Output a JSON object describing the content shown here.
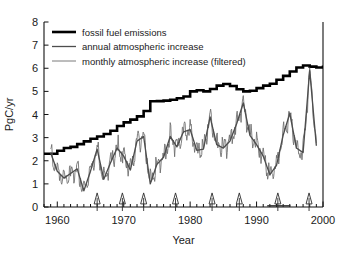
{
  "chart_data": {
    "type": "line",
    "title": "",
    "xlabel": "Year",
    "ylabel": "PgC/yr",
    "xlim": [
      1958,
      2000
    ],
    "ylim": [
      0,
      8
    ],
    "xticks": [
      1960,
      1970,
      1980,
      1990,
      2000
    ],
    "xticklabels": [
      "1960",
      "1970",
      "1980",
      "1990",
      "2000"
    ],
    "yticks": [
      0,
      1,
      2,
      3,
      4,
      5,
      6,
      7,
      8
    ],
    "yticklabels": [
      "0",
      "1",
      "2",
      "3",
      "4",
      "5",
      "6",
      "7",
      "8"
    ],
    "xminor_step": 1,
    "grid": false,
    "legend_position": "upper left",
    "legend": [
      {
        "label": "fossil fuel emissions",
        "color": "#000000",
        "width": 2.6
      },
      {
        "label": "annual atmospheric increase",
        "color": "#4d4d4d",
        "width": 1.3
      },
      {
        "label": "monthly atmospheric increase (filtered)",
        "color": "#6b6b6b",
        "width": 0.9
      }
    ],
    "annotations": {
      "event_arrows": {
        "name": "volcanic-eruption-arrows",
        "symbol": "up-triangle-arrow",
        "y": 0.35,
        "years": [
          1966.0,
          1969.8,
          1973.0,
          1977.8,
          1983.3,
          1987.4,
          1993.2,
          1997.9
        ]
      },
      "interval_bar": {
        "name": "pinatubo-interval-bar",
        "y": 0.05,
        "x_start": 1991.6,
        "x_end": 1995.1
      }
    },
    "series": [
      {
        "name": "fossil fuel emissions",
        "style": "step",
        "color": "#000000",
        "x": [
          1958,
          1959,
          1960,
          1961,
          1962,
          1963,
          1964,
          1965,
          1966,
          1967,
          1968,
          1969,
          1970,
          1971,
          1972,
          1973,
          1974,
          1975,
          1976,
          1977,
          1978,
          1979,
          1980,
          1981,
          1982,
          1983,
          1984,
          1985,
          1986,
          1987,
          1988,
          1989,
          1990,
          1991,
          1992,
          1993,
          1994,
          1995,
          1996,
          1997,
          1998,
          1999,
          2000
        ],
        "values": [
          2.3,
          2.3,
          2.43,
          2.55,
          2.6,
          2.72,
          2.84,
          2.95,
          3.05,
          3.16,
          3.3,
          3.5,
          3.66,
          3.78,
          3.92,
          4.15,
          4.57,
          4.58,
          4.6,
          4.64,
          4.7,
          4.78,
          5.0,
          5.05,
          5.0,
          5.1,
          5.25,
          5.32,
          5.23,
          5.09,
          5.0,
          5.03,
          5.14,
          5.25,
          5.33,
          5.5,
          5.67,
          5.86,
          6.03,
          6.12,
          6.07,
          6.03,
          6.12
        ],
        "values_note": "step-constant annual totals"
      },
      {
        "name": "annual atmospheric increase",
        "style": "line",
        "color": "#4d4d4d",
        "x": [
          1959,
          1960,
          1961,
          1962,
          1963,
          1964,
          1965,
          1966,
          1967,
          1968,
          1969,
          1970,
          1971,
          1972,
          1973,
          1974,
          1975,
          1976,
          1977,
          1978,
          1979,
          1980,
          1981,
          1982,
          1983,
          1984,
          1985,
          1986,
          1987,
          1988,
          1989,
          1990,
          1991,
          1992,
          1993,
          1994,
          1995,
          1996,
          1997,
          1998,
          1999
        ],
        "values": [
          2.35,
          1.55,
          1.25,
          1.45,
          1.65,
          0.7,
          1.55,
          2.5,
          1.2,
          1.9,
          2.55,
          2.2,
          1.6,
          2.85,
          3.05,
          1.0,
          1.85,
          2.15,
          3.05,
          2.6,
          3.25,
          3.35,
          2.45,
          2.5,
          3.9,
          2.7,
          2.55,
          2.85,
          3.6,
          4.5,
          3.1,
          2.7,
          2.2,
          1.4,
          1.8,
          3.1,
          4.05,
          2.55,
          2.35,
          5.9,
          2.65
        ]
      },
      {
        "name": "monthly atmospheric increase (filtered)",
        "style": "line-noisy",
        "color": "#6b6b6b",
        "note": "12-month running value, high-frequency oscillation around the annual curve, plotted monthly 1959-1999"
      }
    ]
  },
  "axes": {
    "ylabel": "PgC/yr",
    "xlabel": "Year"
  }
}
